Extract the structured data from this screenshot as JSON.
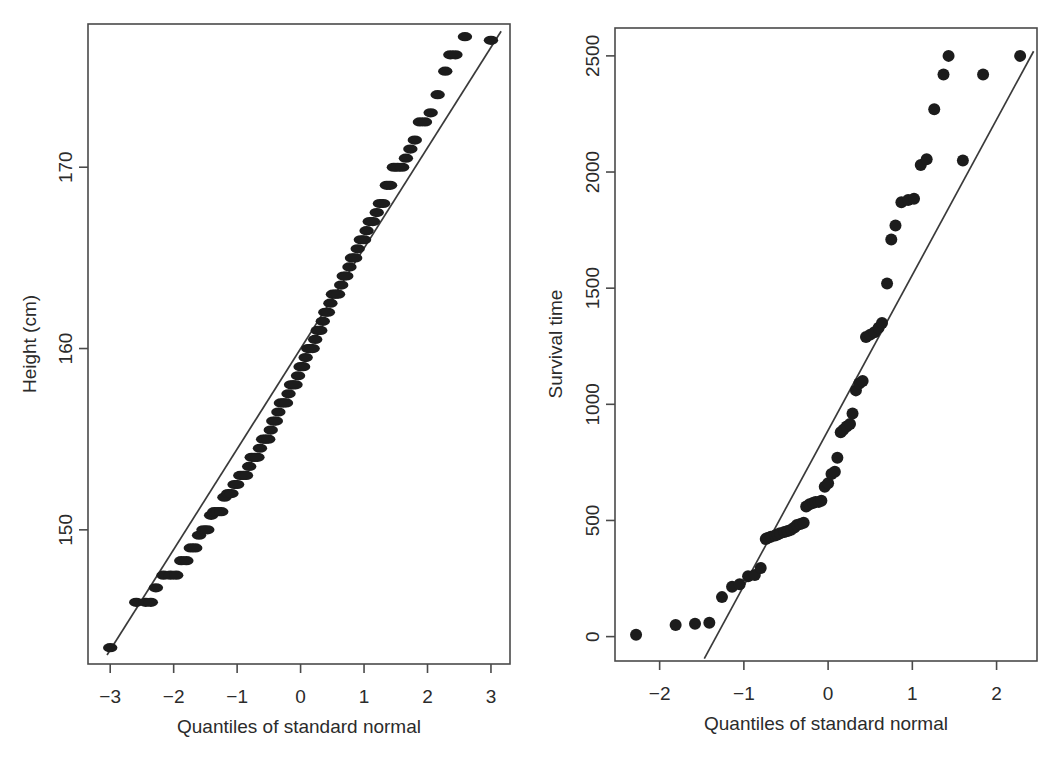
{
  "figure": {
    "background": "#ffffff",
    "point_color": "#1c1c1c",
    "line_color": "#3a3a3a",
    "axis_color": "#4a4a4a",
    "panel_count": 2
  },
  "chart_data": [
    {
      "type": "scatter",
      "name": "height-qq-plot",
      "panel": "left",
      "title": "",
      "xlabel": "Quantiles of standard normal",
      "ylabel": "Height (cm)",
      "xlim": [
        -3.35,
        3.3
      ],
      "ylim": [
        142.6,
        177.9
      ],
      "xticks": [
        -3,
        -2,
        -1,
        0,
        1,
        2,
        3
      ],
      "xticklabels": [
        "−3",
        "−2",
        "−1",
        "0",
        "1",
        "2",
        "3"
      ],
      "yticks": [
        150,
        160,
        170
      ],
      "yticklabels": [
        "150",
        "160",
        "170"
      ],
      "grid": false,
      "legend": false,
      "reference_line": {
        "x": [
          -3.05,
          3.16
        ],
        "y": [
          143.1,
          177.5
        ]
      },
      "x": [
        -3.0,
        -2.59,
        -2.44,
        -2.36,
        -2.28,
        -2.16,
        -2.05,
        -1.96,
        -1.88,
        -1.8,
        -1.73,
        -1.66,
        -1.6,
        -1.53,
        -1.47,
        -1.41,
        -1.36,
        -1.3,
        -1.25,
        -1.2,
        -1.14,
        -1.09,
        -1.04,
        -1.0,
        -0.95,
        -0.9,
        -0.86,
        -0.81,
        -0.77,
        -0.72,
        -0.68,
        -0.64,
        -0.59,
        -0.55,
        -0.51,
        -0.47,
        -0.43,
        -0.39,
        -0.35,
        -0.31,
        -0.27,
        -0.23,
        -0.19,
        -0.15,
        -0.12,
        -0.08,
        -0.04,
        0.0,
        0.04,
        0.08,
        0.12,
        0.15,
        0.19,
        0.23,
        0.27,
        0.31,
        0.35,
        0.39,
        0.43,
        0.47,
        0.51,
        0.55,
        0.59,
        0.64,
        0.68,
        0.72,
        0.77,
        0.81,
        0.86,
        0.9,
        0.95,
        1.0,
        1.04,
        1.09,
        1.14,
        1.2,
        1.25,
        1.3,
        1.36,
        1.41,
        1.47,
        1.53,
        1.6,
        1.66,
        1.73,
        1.8,
        1.88,
        1.96,
        2.05,
        2.16,
        2.28,
        2.36,
        2.44,
        2.59,
        3.0
      ],
      "y": [
        143.5,
        146.0,
        146.0,
        146.0,
        146.8,
        147.5,
        147.5,
        147.5,
        148.3,
        148.3,
        149.0,
        149.0,
        149.7,
        150.0,
        150.0,
        150.8,
        151.0,
        151.0,
        151.0,
        151.8,
        152.0,
        152.0,
        152.5,
        152.5,
        153.0,
        153.0,
        153.0,
        153.5,
        154.0,
        154.0,
        154.0,
        154.5,
        155.0,
        155.0,
        155.0,
        155.5,
        156.0,
        156.0,
        156.5,
        157.0,
        157.0,
        157.0,
        157.5,
        158.0,
        158.0,
        158.0,
        158.5,
        159.0,
        159.0,
        159.5,
        160.0,
        160.0,
        160.0,
        160.5,
        161.0,
        161.0,
        161.5,
        162.0,
        162.0,
        162.5,
        163.0,
        163.0,
        163.0,
        163.5,
        164.0,
        164.0,
        164.5,
        165.0,
        165.0,
        165.5,
        166.0,
        166.0,
        166.5,
        167.0,
        167.0,
        167.5,
        168.0,
        168.0,
        169.0,
        169.0,
        170.0,
        170.0,
        170.0,
        170.5,
        171.0,
        171.5,
        172.5,
        172.5,
        173.0,
        174.0,
        175.3,
        176.2,
        176.2,
        177.2,
        177.0
      ]
    },
    {
      "type": "scatter",
      "name": "survival-time-qq-plot",
      "panel": "right",
      "title": "",
      "xlabel": "Quantiles of standard normal",
      "ylabel": "Survival time",
      "xlim": [
        -2.53,
        2.48
      ],
      "ylim": [
        -105,
        2620
      ],
      "xticks": [
        -2,
        -1,
        0,
        1,
        2
      ],
      "xticklabels": [
        "−2",
        "−1",
        "0",
        "1",
        "2"
      ],
      "yticks": [
        0,
        500,
        1000,
        1500,
        2000,
        2500
      ],
      "yticklabels": [
        "0",
        "500",
        "1000",
        "1500",
        "2000",
        "2500"
      ],
      "grid": false,
      "legend": false,
      "reference_line": {
        "x": [
          -1.47,
          2.44
        ],
        "y": [
          -95,
          2520
        ]
      },
      "x": [
        -2.28,
        -1.81,
        -1.58,
        -1.41,
        -1.26,
        -1.14,
        -1.05,
        -0.95,
        -0.87,
        -0.8,
        -0.74,
        -0.72,
        -0.68,
        -0.63,
        -0.6,
        -0.57,
        -0.52,
        -0.48,
        -0.44,
        -0.4,
        -0.37,
        -0.33,
        -0.29,
        -0.26,
        -0.22,
        -0.18,
        -0.15,
        -0.11,
        -0.08,
        -0.04,
        0.0,
        0.04,
        0.08,
        0.11,
        0.15,
        0.18,
        0.22,
        0.26,
        0.29,
        0.33,
        0.37,
        0.41,
        0.45,
        0.5,
        0.55,
        0.6,
        0.64,
        0.7,
        0.75,
        0.8,
        0.87,
        0.95,
        1.02,
        1.1,
        1.17,
        1.26,
        1.37,
        1.43,
        1.6,
        1.84,
        2.28
      ],
      "y": [
        8,
        50,
        55,
        60,
        170,
        215,
        225,
        260,
        265,
        295,
        420,
        425,
        430,
        435,
        440,
        445,
        450,
        455,
        460,
        470,
        480,
        485,
        490,
        560,
        570,
        575,
        580,
        580,
        585,
        645,
        660,
        700,
        710,
        770,
        880,
        890,
        905,
        915,
        960,
        1060,
        1090,
        1100,
        1290,
        1300,
        1310,
        1330,
        1350,
        1520,
        1710,
        1770,
        1870,
        1880,
        1885,
        2030,
        2055,
        2270,
        2420,
        2500,
        2050,
        2420,
        2500
      ]
    }
  ]
}
